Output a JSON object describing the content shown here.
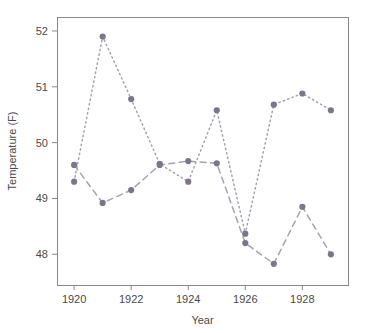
{
  "chart_data": {
    "type": "line",
    "title": "",
    "xlabel": "Year",
    "ylabel": "Temperature (F)",
    "x": [
      1920,
      1921,
      1922,
      1923,
      1924,
      1925,
      1926,
      1927,
      1928,
      1929
    ],
    "xlim": [
      1919.4,
      1929.6
    ],
    "ylim": [
      47.45,
      52.25
    ],
    "xticks": [
      1920,
      1922,
      1924,
      1926,
      1928
    ],
    "xtick_labels": [
      "1920",
      "1922",
      "1924",
      "1926",
      "1928"
    ],
    "yticks": [
      48,
      49,
      50,
      51,
      52
    ],
    "ytick_labels": [
      "48",
      "49",
      "50",
      "51",
      "52"
    ],
    "grid": false,
    "legend": "none",
    "series": [
      {
        "name": "series-dotted",
        "linestyle": "dotted",
        "color": "#8a8296",
        "marker": "circle",
        "values": [
          49.3,
          51.9,
          50.78,
          49.62,
          49.3,
          50.58,
          48.37,
          50.68,
          50.88,
          50.58
        ]
      },
      {
        "name": "series-dashed",
        "linestyle": "dashed",
        "color": "#8a8296",
        "marker": "circle",
        "values": [
          49.6,
          48.92,
          49.15,
          49.6,
          49.67,
          49.63,
          48.2,
          47.83,
          48.85,
          48.0
        ]
      }
    ],
    "colors": {
      "marker": "#7d7689",
      "line": "#a7a0b0",
      "frame": "#888888",
      "text": "#4a4a4a",
      "background": "#ffffff"
    },
    "plot_box": {
      "left": 57,
      "top": 17,
      "right": 348,
      "bottom": 285
    }
  }
}
